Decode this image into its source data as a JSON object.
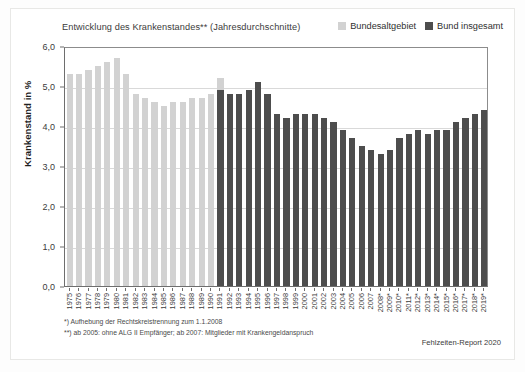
{
  "chart_data": {
    "type": "bar",
    "title": "Entwicklung des Krankenstandes** (Jahresdurchschnitte)",
    "xlabel": "",
    "ylabel": "Krankenstand in %",
    "ylim": [
      0.0,
      6.0
    ],
    "ytick_step": 1.0,
    "ytick_labels": [
      "0,0",
      "1,0",
      "2,0",
      "3,0",
      "4,0",
      "5,0",
      "6,0"
    ],
    "ytick_values": [
      0.0,
      1.0,
      2.0,
      3.0,
      4.0,
      5.0,
      6.0
    ],
    "grid": true,
    "legend_position": "top-right",
    "categories": [
      "1975",
      "1976",
      "1977",
      "1978",
      "1979",
      "1980",
      "1981",
      "1982",
      "1983",
      "1984",
      "1985",
      "1986",
      "1987",
      "1988",
      "1989",
      "1990",
      "1991",
      "1992",
      "1993",
      "1994",
      "1995",
      "1996",
      "1997",
      "1998",
      "1999",
      "2000",
      "2001",
      "2002",
      "2003",
      "2004",
      "2005",
      "2006",
      "2007",
      "2008*",
      "2009*",
      "2010*",
      "2011*",
      "2012*",
      "2013*",
      "2014*",
      "2015*",
      "2016*",
      "2017*",
      "2018*",
      "2019*"
    ],
    "series": [
      {
        "name": "Bundesaltgebiet",
        "color": "#d2d2d2",
        "values": [
          5.3,
          5.3,
          5.4,
          5.5,
          5.6,
          5.7,
          5.3,
          4.8,
          4.7,
          4.6,
          4.5,
          4.6,
          4.6,
          4.7,
          4.7,
          4.8,
          5.2,
          null,
          null,
          null,
          null,
          null,
          null,
          null,
          null,
          null,
          null,
          null,
          null,
          null,
          null,
          null,
          null,
          null,
          null,
          null,
          null,
          null,
          null,
          null,
          null,
          null,
          null,
          null,
          null
        ]
      },
      {
        "name": "Bund insgesamt",
        "color": "#4d4d4d",
        "values": [
          null,
          null,
          null,
          null,
          null,
          null,
          null,
          null,
          null,
          null,
          null,
          null,
          null,
          null,
          null,
          null,
          4.9,
          4.8,
          4.8,
          4.9,
          5.1,
          4.8,
          4.3,
          4.2,
          4.3,
          4.3,
          4.3,
          4.2,
          4.1,
          3.9,
          3.7,
          3.5,
          3.4,
          3.3,
          3.4,
          3.7,
          3.8,
          3.9,
          3.8,
          3.9,
          3.9,
          4.1,
          4.2,
          4.3,
          4.4
        ]
      }
    ],
    "legend": [
      {
        "label": "Bundesaltgebiet",
        "color": "#d2d2d2"
      },
      {
        "label": "Bund insgesamt",
        "color": "#4d4d4d"
      }
    ]
  },
  "footnotes": [
    "*) Aufhebung der Rechtskreistrennung zum 1.1.2008",
    "**) ab 2005: ohne ALG II Empfänger; ab 2007: Mitglieder mit Krankengeldanspruch"
  ],
  "source_note": "Fehlzeiten-Report 2020"
}
